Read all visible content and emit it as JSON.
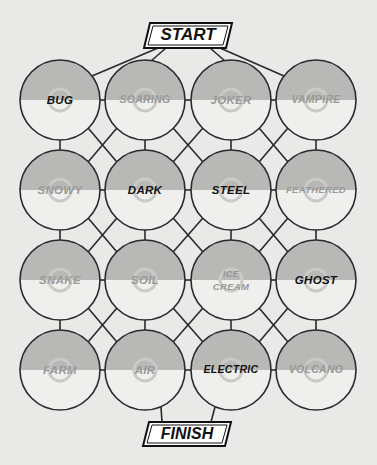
{
  "puzzle": {
    "start_label": "START",
    "finish_label": "FINISH",
    "colors": {
      "background": "#e9e9e7",
      "ball_top": "#b8b8b6",
      "ball_bottom": "#efefed",
      "line": "#2a2a2a",
      "label_highlight": "#111111",
      "label_dim": "#9a9a98",
      "center_ring": "#c9c9c7"
    },
    "grid": [
      [
        {
          "label": "BUG",
          "highlight": true
        },
        {
          "label": "SOARING",
          "highlight": false
        },
        {
          "label": "JOKER",
          "highlight": false
        },
        {
          "label": "VAMPIRE",
          "highlight": false
        }
      ],
      [
        {
          "label": "SNOWY",
          "highlight": false
        },
        {
          "label": "DARK",
          "highlight": true
        },
        {
          "label": "STEEL",
          "highlight": true
        },
        {
          "label": "FEATHERED",
          "highlight": false
        }
      ],
      [
        {
          "label": "SNAKE",
          "highlight": false
        },
        {
          "label": "SOIL",
          "highlight": false
        },
        {
          "label": "ICE CREAM",
          "highlight": false
        },
        {
          "label": "GHOST",
          "highlight": true
        }
      ],
      [
        {
          "label": "FARM",
          "highlight": false
        },
        {
          "label": "AIR",
          "highlight": false
        },
        {
          "label": "ELECTRIC",
          "highlight": true
        },
        {
          "label": "VOLCANO",
          "highlight": false
        }
      ]
    ]
  }
}
